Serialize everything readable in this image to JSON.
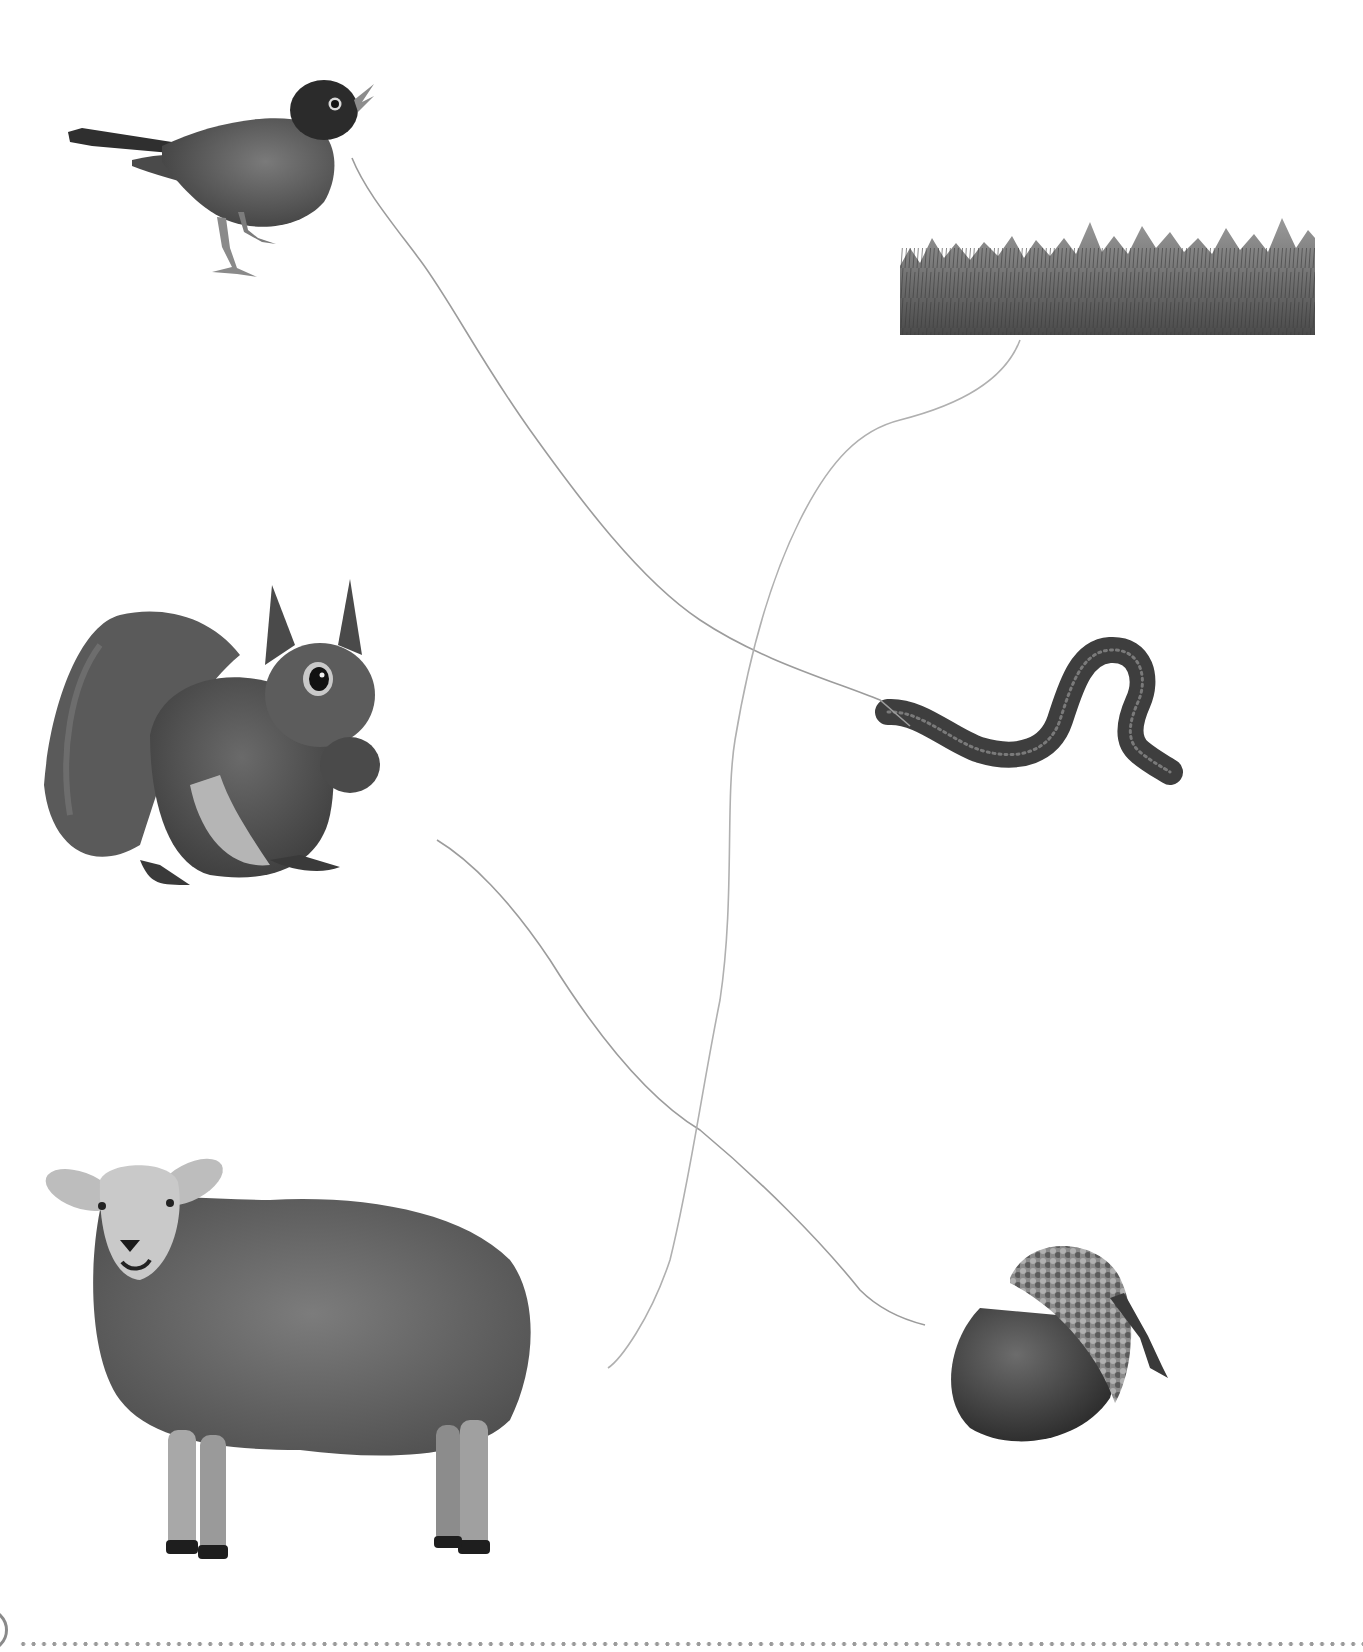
{
  "worksheet": {
    "type": "matching-exercise",
    "left_column": [
      {
        "id": "robin",
        "label": "robin"
      },
      {
        "id": "squirrel",
        "label": "squirrel"
      },
      {
        "id": "sheep",
        "label": "sheep"
      }
    ],
    "right_column": [
      {
        "id": "grass",
        "label": "grass"
      },
      {
        "id": "worm",
        "label": "worm"
      },
      {
        "id": "acorn",
        "label": "acorn"
      }
    ],
    "drawn_connections": [
      {
        "from": "robin",
        "to": "worm"
      },
      {
        "from": "squirrel",
        "to": "acorn"
      },
      {
        "from": "grass",
        "to": "sheep"
      }
    ]
  },
  "colors": {
    "background": "#ffffff",
    "pencil_line": "#9c9c9c",
    "footer_dots": "#9a9a9a",
    "footer_circle": "#8a8a8a"
  }
}
